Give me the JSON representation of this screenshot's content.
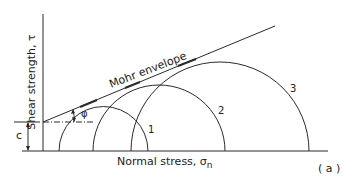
{
  "figure": {
    "panel_label": "( a )",
    "y_axis_label": "Shear strength, τ",
    "x_axis_label": "Normal stress, σ",
    "x_axis_subscript": "n",
    "envelope_label": "Mohr envelope",
    "cohesion_label": "c",
    "friction_angle_label": "φ",
    "circles": [
      {
        "label": "1"
      },
      {
        "label": "2"
      },
      {
        "label": "3"
      }
    ],
    "line_color": "#2a2a2a"
  }
}
